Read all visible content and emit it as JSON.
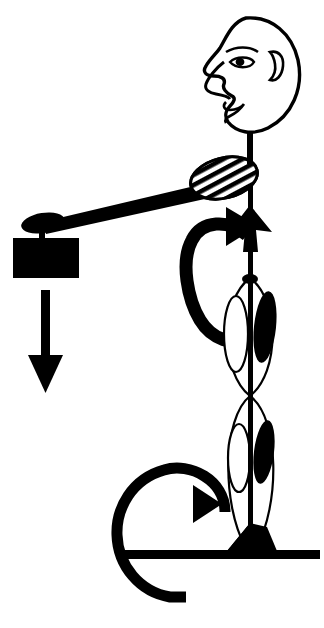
{
  "document": {
    "title": "Human body lever diagram",
    "subject": "side-view stick figure holding a weight",
    "background_color": "#ffffff",
    "ink_color": "#000000",
    "width": 324,
    "height": 628
  },
  "figure": {
    "parts": [
      {
        "id": "head",
        "label": "Head in profile",
        "type": "outline"
      },
      {
        "id": "eye",
        "label": "Eye",
        "type": "outline-filled"
      },
      {
        "id": "ear",
        "label": "Ear",
        "type": "outline"
      },
      {
        "id": "nose",
        "label": "Nose",
        "type": "outline"
      },
      {
        "id": "lips",
        "label": "Lips",
        "type": "outline"
      },
      {
        "id": "neck",
        "label": "Neck",
        "type": "line"
      },
      {
        "id": "shoulder-muscle",
        "label": "Shoulder muscle",
        "type": "hatched-ellipse"
      },
      {
        "id": "arm",
        "label": "Arm",
        "type": "tapered-bar"
      },
      {
        "id": "hand",
        "label": "Hand grip",
        "type": "filled-ellipse"
      },
      {
        "id": "weight-block",
        "label": "Weight",
        "type": "filled-rectangle"
      },
      {
        "id": "spine",
        "label": "Spine and leg axis",
        "type": "line"
      },
      {
        "id": "thigh-front-muscle",
        "label": "Upper front muscle",
        "type": "outline-ellipse"
      },
      {
        "id": "thigh-back-muscle",
        "label": "Upper rear muscle",
        "type": "filled-ellipse"
      },
      {
        "id": "shank-front-muscle",
        "label": "Lower front muscle",
        "type": "outline-ellipse"
      },
      {
        "id": "shank-back-muscle",
        "label": "Lower rear muscle",
        "type": "filled-ellipse"
      },
      {
        "id": "foot",
        "label": "Foot",
        "type": "filled-wedge"
      },
      {
        "id": "ground-line",
        "label": "Ground",
        "type": "filled-bar"
      }
    ]
  },
  "annotations": {
    "force_arrow": {
      "name": "weight-force-arrow",
      "label": "",
      "direction": "down",
      "meaning": "Gravitational load of the held weight"
    },
    "hip_arrow": {
      "name": "hip-rotation-arrow",
      "label": "",
      "direction": "clockwise",
      "meaning": "Rotation moment at the hip joint"
    },
    "ankle_arrow": {
      "name": "ankle-rotation-arrow",
      "label": "",
      "direction": "clockwise",
      "meaning": "Rotation moment at the ankle joint"
    },
    "shoulder_arrowhead": {
      "name": "shoulder-axis-arrowhead",
      "label": "",
      "direction": "up",
      "meaning": "Reaction along the body axis at the shoulder"
    }
  },
  "caption": {
    "text": ""
  }
}
